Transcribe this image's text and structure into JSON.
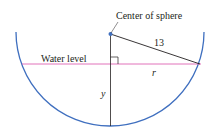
{
  "diagram": {
    "labels": {
      "center": "Center of sphere",
      "radius": "13",
      "water_level": "Water level",
      "r": "r",
      "y": "y"
    },
    "colors": {
      "sphere": "#3f6fbf",
      "water": "#d94fa8",
      "lines": "#231f20"
    }
  }
}
